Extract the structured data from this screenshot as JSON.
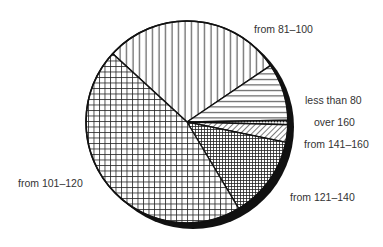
{
  "chart_data": {
    "type": "pie",
    "title": "",
    "slices": [
      {
        "label": "from 81–100",
        "value": 28.7,
        "pattern": "vertical"
      },
      {
        "label": "less than 80",
        "value": 9.2,
        "pattern": "horizontal"
      },
      {
        "label": "over 160",
        "value": 0.7,
        "pattern": "dots"
      },
      {
        "label": "from 141–160",
        "value": 2.8,
        "pattern": "diagonal"
      },
      {
        "label": "from 121–140",
        "value": 13.2,
        "pattern": "fine-grid"
      },
      {
        "label": "from 101–120",
        "value": 45.4,
        "pattern": "grid"
      }
    ],
    "legend": "labels placed beside slices",
    "start_angle_deg": -137.4,
    "shadow": true
  },
  "labels": {
    "l81": "from 81–100",
    "l80": "less than 80",
    "l160": "over 160",
    "l141": "from 141–160",
    "l121": "from 121–140",
    "l101": "from 101–120"
  }
}
